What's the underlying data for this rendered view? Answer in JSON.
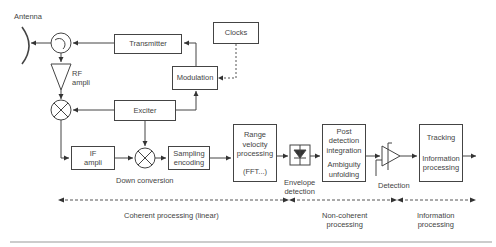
{
  "diagram": {
    "antenna": "Antenna",
    "rf_ampli": [
      "RF",
      "ampli"
    ],
    "transmitter": "Transmitter",
    "clocks": "Clocks",
    "modulation": "Modulation",
    "exciter": "Exciter",
    "if_ampli": [
      "IF",
      "ampli"
    ],
    "sampling": [
      "Sampling",
      "encoding"
    ],
    "down_conversion": "Down conversion",
    "range_velocity": [
      "Range",
      "velocity",
      "processing",
      "(FFT...)"
    ],
    "envelope_detection": [
      "Envelope",
      "detection"
    ],
    "post_detection": [
      "Post",
      "detection",
      "integration",
      "Ambiguity",
      "unfolding"
    ],
    "detection": "Detection",
    "tracking": [
      "Tracking",
      "Information",
      "processing"
    ],
    "stages": {
      "coherent": "Coherent processing (linear)",
      "noncoherent": [
        "Non-coherent",
        "processing"
      ],
      "information": [
        "Information",
        "processing"
      ]
    }
  }
}
